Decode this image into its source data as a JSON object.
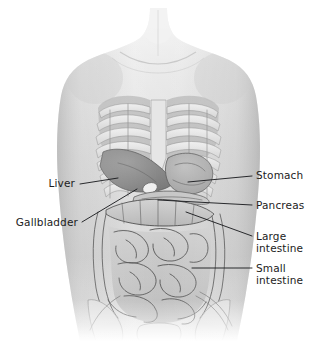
{
  "figure": {
    "kind": "anatomical-illustration",
    "style": "grayscale medical illustration",
    "width": 317,
    "height": 341
  },
  "colors": {
    "background": "#ffffff",
    "top_rule": "#7d7d7d",
    "skin_light": "#efefef",
    "skin_mid": "#cfcfcf",
    "skin_shadow": "#a9a9a9",
    "bone_light": "#e8e8e8",
    "bone_shadow": "#b4b4b4",
    "intercostal": "#9a9a9a",
    "liver": "#8c8c8c",
    "stomach": "#b0b0b0",
    "pancreas": "#c2c2c2",
    "large_intestine": "#bdbdbd",
    "small_intestine": "#c8c8c8",
    "outline": "#4a4a4a",
    "leader_line": "#15161a",
    "label_text": "#1c1c1c"
  },
  "labels": {
    "left": [
      {
        "id": "liver",
        "text": "Liver",
        "text_x": 75,
        "text_y": 187,
        "leader": "M 80,184 L 118,178"
      },
      {
        "id": "gallbladder",
        "text": "Gallbladder",
        "text_x": 78,
        "text_y": 226,
        "leader": "M 82,222 L 137,189"
      }
    ],
    "right": [
      {
        "id": "stomach",
        "text": "Stomach",
        "text_x": 256,
        "text_y": 179,
        "leader": "M 252,176 L 188,182"
      },
      {
        "id": "pancreas",
        "text": "Pancreas",
        "text_x": 256,
        "text_y": 209,
        "leader": "M 252,205 L 158,200"
      },
      {
        "id": "large-intestine",
        "text": "Large",
        "text2": "intestine",
        "text_x": 256,
        "text_y": 240,
        "text2_y": 252,
        "leader": "M 252,236 L 186,212"
      },
      {
        "id": "small-intestine",
        "text": "Small",
        "text2": "intestine",
        "text_x": 256,
        "text_y": 272,
        "text2_y": 284,
        "leader": "M 252,268 L 192,268"
      }
    ]
  }
}
